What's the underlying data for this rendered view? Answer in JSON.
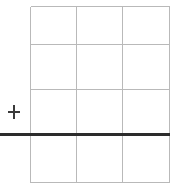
{
  "figure": {
    "title": "",
    "width": 182,
    "height": 194,
    "background_color": "#ffffff"
  },
  "grid": {
    "name": "rectangular-grid",
    "columns": 3,
    "rows": 4,
    "line_color": "#b9b9b9",
    "line_width": 1,
    "left": 30,
    "right": 169,
    "top": 6,
    "bottom": 182,
    "vertical_lines_x": [
      30,
      76,
      122,
      169
    ],
    "horizontal_lines_y": [
      6,
      44,
      89,
      134,
      182
    ],
    "cell_width": 46,
    "cell_height": 44
  },
  "baseline": {
    "name": "thick-horizontal-rule",
    "color": "#2c2c2c",
    "line_width": 3,
    "y": 134,
    "x_start": 0,
    "x_end": 170,
    "extends_past_grid_left": true
  },
  "marker": {
    "name": "plus-crosshair-marker",
    "symbol": "+",
    "color": "#3a3a3a",
    "center_x": 14,
    "center_y": 112,
    "arm_length": 12,
    "line_width": 2
  },
  "chart_data": {
    "type": "line",
    "title": "",
    "xlabel": "",
    "ylabel": "",
    "grid": true,
    "legend": "none",
    "xlim": [
      0,
      3
    ],
    "ylim": [
      0,
      4
    ],
    "xticks": [
      0,
      1,
      2,
      3
    ],
    "yticks": [
      0,
      1,
      2,
      3,
      4
    ],
    "xticklabels": [
      "",
      "",
      "",
      ""
    ],
    "yticklabels": [
      "",
      "",
      "",
      "",
      ""
    ],
    "series": [
      {
        "name": "baseline",
        "type": "hline",
        "values": [
          1,
          1
        ],
        "x": [
          -0.65,
          3
        ],
        "color": "#2c2c2c"
      }
    ],
    "annotations": [
      {
        "text": "+",
        "x": -0.35,
        "y": 1.5,
        "color": "#3a3a3a"
      }
    ]
  }
}
